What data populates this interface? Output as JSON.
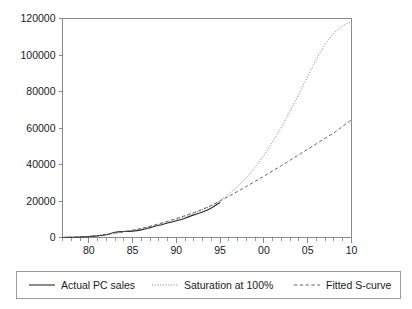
{
  "chart_data": {
    "type": "line",
    "title": "",
    "subtitle": "",
    "xlabel": "",
    "ylabel": "",
    "xlim": [
      77,
      110
    ],
    "ylim": [
      0,
      120000
    ],
    "grid": false,
    "legend_position": "bottom",
    "x_tick_labels": [
      "80",
      "85",
      "90",
      "95",
      "00",
      "05",
      "10"
    ],
    "x_tick_values": [
      80,
      85,
      90,
      95,
      100,
      105,
      110
    ],
    "x_minor_tick_values": [
      77,
      78,
      79,
      81,
      82,
      83,
      84,
      86,
      87,
      88,
      89,
      91,
      92,
      93,
      94,
      96,
      97,
      98,
      99,
      101,
      102,
      103,
      104,
      106,
      107,
      108,
      109
    ],
    "y_tick_labels": [
      "0",
      "20000",
      "40000",
      "60000",
      "80000",
      "100000",
      "120000"
    ],
    "y_tick_values": [
      0,
      20000,
      40000,
      60000,
      80000,
      100000,
      120000
    ],
    "x": [
      77,
      78,
      79,
      80,
      81,
      82,
      83,
      84,
      85,
      86,
      87,
      88,
      89,
      90,
      91,
      92,
      93,
      94,
      95,
      96,
      97,
      98,
      99,
      100,
      101,
      102,
      103,
      104,
      105,
      106,
      107,
      108,
      109,
      110
    ],
    "series": [
      {
        "name": "Actual PC sales",
        "style": "solid",
        "color": "#2b2b2b",
        "width": 1.1,
        "values": [
          40,
          90,
          200,
          500,
          900,
          1500,
          2900,
          3300,
          3500,
          4200,
          5400,
          6700,
          7900,
          9200,
          10600,
          12400,
          14000,
          16200,
          19300,
          null,
          null,
          null,
          null,
          null,
          null,
          null,
          null,
          null,
          null,
          null,
          null,
          null,
          null,
          null
        ]
      },
      {
        "name": "Saturation at 100%",
        "style": "dotted",
        "color": "#6e6e6e",
        "width": 0.9,
        "values": [
          60,
          130,
          280,
          560,
          1000,
          1700,
          2500,
          3200,
          3900,
          4800,
          5900,
          7100,
          8400,
          9800,
          11400,
          13200,
          15100,
          17400,
          20300,
          23800,
          28000,
          32900,
          38600,
          45100,
          52400,
          60500,
          69300,
          78700,
          88300,
          97600,
          105800,
          112000,
          116000,
          118200
        ]
      },
      {
        "name": "Fitted S-curve",
        "style": "dashed",
        "color": "#555555",
        "width": 0.9,
        "values": [
          70,
          160,
          330,
          620,
          1050,
          1650,
          2400,
          3150,
          4000,
          5000,
          6200,
          7500,
          8900,
          10400,
          12000,
          13700,
          15500,
          17600,
          20000,
          22600,
          25300,
          28000,
          30800,
          33600,
          36500,
          39400,
          42400,
          45400,
          48400,
          51400,
          54400,
          57400,
          60900,
          64500
        ]
      }
    ]
  },
  "legend": {
    "items": [
      {
        "label": "Actual PC sales",
        "style": "solid"
      },
      {
        "label": "Saturation at 100%",
        "style": "dotted"
      },
      {
        "label": "Fitted S-curve",
        "style": "dashed"
      }
    ]
  }
}
